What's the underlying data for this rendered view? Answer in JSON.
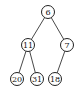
{
  "diagram": {
    "type": "binary-tree",
    "nodes": [
      {
        "id": "n6",
        "label": "6",
        "x": 48,
        "y": 12
      },
      {
        "id": "n11",
        "label": "11",
        "x": 28,
        "y": 45
      },
      {
        "id": "n7",
        "label": "7",
        "x": 67,
        "y": 45
      },
      {
        "id": "n20",
        "label": "20",
        "x": 17,
        "y": 79
      },
      {
        "id": "n31",
        "label": "31",
        "x": 37,
        "y": 79
      },
      {
        "id": "n18",
        "label": "18",
        "x": 55,
        "y": 79
      }
    ],
    "edges": [
      {
        "from": "n6",
        "to": "n11"
      },
      {
        "from": "n6",
        "to": "n7"
      },
      {
        "from": "n11",
        "to": "n20"
      },
      {
        "from": "n11",
        "to": "n31"
      },
      {
        "from": "n7",
        "to": "n18"
      }
    ],
    "node_radius": 6.5
  }
}
